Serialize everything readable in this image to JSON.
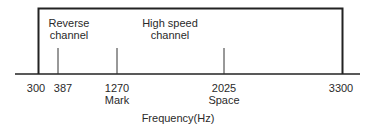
{
  "diagram": {
    "type": "frequency-band",
    "axis_label": "Frequency(Hz)",
    "band": {
      "start": 300,
      "end": 3300
    },
    "ticks": [
      {
        "value": "300",
        "sublabel": ""
      },
      {
        "value": "387",
        "sublabel": ""
      },
      {
        "value": "1270",
        "sublabel": "Mark"
      },
      {
        "value": "2025",
        "sublabel": "Space"
      },
      {
        "value": "3300",
        "sublabel": ""
      }
    ],
    "regions": [
      {
        "line1": "Reverse",
        "line2": "channel"
      },
      {
        "line1": "High speed",
        "line2": "channel"
      }
    ],
    "colors": {
      "line": "#222222",
      "text": "#2a2a2a",
      "background": "#ffffff"
    }
  }
}
